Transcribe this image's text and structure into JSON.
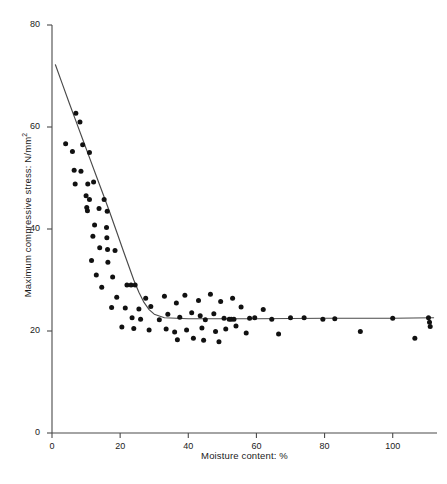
{
  "chart_data": {
    "type": "scatter",
    "title": "",
    "xlabel": "Moisture content: %",
    "ylabel": "Maximum compressive stress: N/mm",
    "ylabel_sup": "2",
    "xlim": [
      0,
      113
    ],
    "ylim": [
      0,
      80
    ],
    "xticks": [
      0,
      20,
      40,
      60,
      80,
      100
    ],
    "yticks": [
      0,
      20,
      40,
      60,
      80
    ],
    "grid": false,
    "legend": null,
    "marker": "filled-circle",
    "marker_color": "#111111",
    "line_color": "#4a4a4a",
    "axis_color": "#4a4a4a",
    "points": [
      [
        7.0,
        62.7
      ],
      [
        8.2,
        61.0
      ],
      [
        4.0,
        56.7
      ],
      [
        6.0,
        55.2
      ],
      [
        9.0,
        56.5
      ],
      [
        11.0,
        55.0
      ],
      [
        6.5,
        51.5
      ],
      [
        8.5,
        51.3
      ],
      [
        6.8,
        48.8
      ],
      [
        10.5,
        48.8
      ],
      [
        12.2,
        49.2
      ],
      [
        10.0,
        46.5
      ],
      [
        11.0,
        45.8
      ],
      [
        15.3,
        45.8
      ],
      [
        10.2,
        44.2
      ],
      [
        10.4,
        43.6
      ],
      [
        13.8,
        44.0
      ],
      [
        16.2,
        43.5
      ],
      [
        12.5,
        40.8
      ],
      [
        16.0,
        40.3
      ],
      [
        12.0,
        38.6
      ],
      [
        16.1,
        38.3
      ],
      [
        14.0,
        36.3
      ],
      [
        16.3,
        36.0
      ],
      [
        18.5,
        35.8
      ],
      [
        11.6,
        33.8
      ],
      [
        16.4,
        33.5
      ],
      [
        13.0,
        31.0
      ],
      [
        17.8,
        30.6
      ],
      [
        14.6,
        28.6
      ],
      [
        22.0,
        29.0
      ],
      [
        23.2,
        29.0
      ],
      [
        24.4,
        29.0
      ],
      [
        19.0,
        26.6
      ],
      [
        27.5,
        26.4
      ],
      [
        17.5,
        24.6
      ],
      [
        21.5,
        24.5
      ],
      [
        25.5,
        24.3
      ],
      [
        29.0,
        24.8
      ],
      [
        23.5,
        22.6
      ],
      [
        26.0,
        22.3
      ],
      [
        31.5,
        22.2
      ],
      [
        20.5,
        20.8
      ],
      [
        24.0,
        20.5
      ],
      [
        28.5,
        20.2
      ],
      [
        33.0,
        26.8
      ],
      [
        36.5,
        25.5
      ],
      [
        39.0,
        27.0
      ],
      [
        34.0,
        23.3
      ],
      [
        37.5,
        22.7
      ],
      [
        41.0,
        23.6
      ],
      [
        33.5,
        20.4
      ],
      [
        36.0,
        19.8
      ],
      [
        39.5,
        20.2
      ],
      [
        36.8,
        18.3
      ],
      [
        41.5,
        18.6
      ],
      [
        43.0,
        26.0
      ],
      [
        46.5,
        27.2
      ],
      [
        49.5,
        25.8
      ],
      [
        43.5,
        23.0
      ],
      [
        45.0,
        22.2
      ],
      [
        47.5,
        23.4
      ],
      [
        50.5,
        22.5
      ],
      [
        44.0,
        20.6
      ],
      [
        48.0,
        19.9
      ],
      [
        51.0,
        20.4
      ],
      [
        44.5,
        18.2
      ],
      [
        49.0,
        17.9
      ],
      [
        53.0,
        26.4
      ],
      [
        55.5,
        24.7
      ],
      [
        58.0,
        22.5
      ],
      [
        54.0,
        21.0
      ],
      [
        57.0,
        19.6
      ],
      [
        59.5,
        22.6
      ],
      [
        52.0,
        22.3
      ],
      [
        52.6,
        22.3
      ],
      [
        53.4,
        22.3
      ],
      [
        62.0,
        24.2
      ],
      [
        64.5,
        22.3
      ],
      [
        66.5,
        19.4
      ],
      [
        70.0,
        22.6
      ],
      [
        74.0,
        22.6
      ],
      [
        79.5,
        22.3
      ],
      [
        83.0,
        22.4
      ],
      [
        90.5,
        19.9
      ],
      [
        100.0,
        22.5
      ],
      [
        106.5,
        18.6
      ],
      [
        110.5,
        22.6
      ],
      [
        110.8,
        21.7
      ],
      [
        111.0,
        20.9
      ]
    ],
    "fit_curve": {
      "description": "fitted bilinear/exponential decay curve with plateau",
      "points": [
        [
          1.0,
          72.2
        ],
        [
          3.0,
          68.5
        ],
        [
          5.0,
          64.8
        ],
        [
          7.0,
          61.2
        ],
        [
          9.0,
          57.6
        ],
        [
          11.0,
          54.0
        ],
        [
          13.0,
          50.4
        ],
        [
          15.0,
          46.8
        ],
        [
          17.0,
          43.2
        ],
        [
          19.0,
          39.4
        ],
        [
          21.0,
          35.6
        ],
        [
          22.5,
          32.8
        ],
        [
          24.0,
          30.0
        ],
        [
          25.5,
          27.6
        ],
        [
          27.0,
          25.6
        ],
        [
          28.5,
          24.2
        ],
        [
          30.0,
          23.3
        ],
        [
          33.0,
          22.6
        ],
        [
          40.0,
          22.4
        ],
        [
          60.0,
          22.4
        ],
        [
          80.0,
          22.5
        ],
        [
          100.0,
          22.5
        ],
        [
          112.0,
          22.6
        ]
      ]
    }
  }
}
